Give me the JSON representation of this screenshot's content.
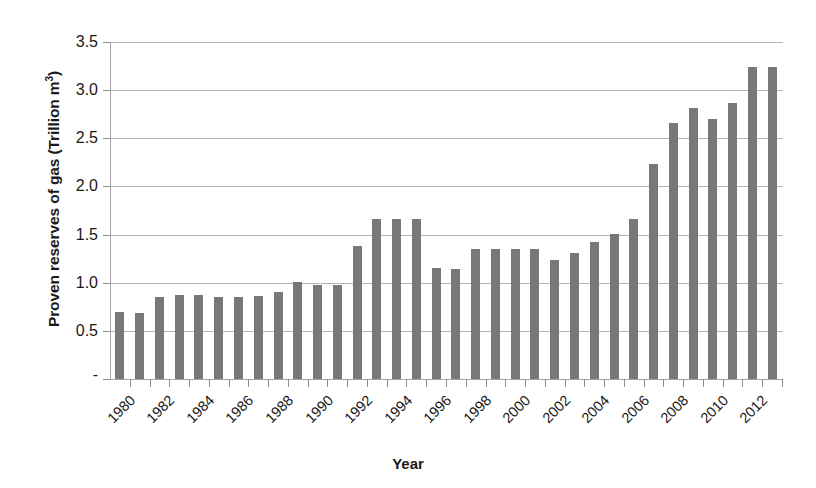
{
  "chart_data": {
    "type": "bar",
    "title": "",
    "xlabel": "Year",
    "ylabel": "Proven reserves of gas  (Trillion m3)",
    "ylabel_plain": "Proven reserves of gas  (Trillion m",
    "ylabel_sup": "3",
    "ylabel_close": ")",
    "ylim": [
      0,
      3.5
    ],
    "grid": true,
    "legend": "none",
    "y_ticks": [
      "-",
      "0.5",
      "1.0",
      "1.5",
      "2.0",
      "2.5",
      "3.0",
      "3.5"
    ],
    "y_tick_values": [
      0,
      0.5,
      1.0,
      1.5,
      2.0,
      2.5,
      3.0,
      3.5
    ],
    "x_tick_labels": [
      "1980",
      "1982",
      "1984",
      "1986",
      "1988",
      "1990",
      "1992",
      "1994",
      "1996",
      "1998",
      "2000",
      "2002",
      "2004",
      "2006",
      "2008",
      "2010",
      "2012"
    ],
    "categories": [
      "1980",
      "1981",
      "1982",
      "1983",
      "1984",
      "1985",
      "1986",
      "1987",
      "1988",
      "1989",
      "1990",
      "1991",
      "1992",
      "1993",
      "1994",
      "1995",
      "1996",
      "1997",
      "1998",
      "1999",
      "2000",
      "2001",
      "2002",
      "2003",
      "2004",
      "2005",
      "2006",
      "2007",
      "2008",
      "2009",
      "2010",
      "2011",
      "2012",
      "2013"
    ],
    "values": [
      0.7,
      0.69,
      0.85,
      0.87,
      0.87,
      0.85,
      0.85,
      0.86,
      0.9,
      1.01,
      0.98,
      0.98,
      1.38,
      1.66,
      1.66,
      1.66,
      1.15,
      1.14,
      1.35,
      1.35,
      1.35,
      1.35,
      1.24,
      1.31,
      1.42,
      1.51,
      1.66,
      2.23,
      2.66,
      2.81,
      2.7,
      2.87,
      3.24,
      3.24
    ],
    "bar_color": "#787878",
    "gridline_color": "#b3b3b3",
    "axis_color": "#a6a6a6"
  }
}
